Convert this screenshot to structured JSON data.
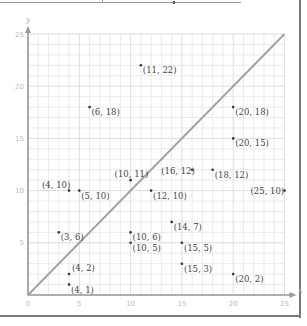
{
  "chart_data": {
    "type": "scatter",
    "title": "",
    "xlabel": "x",
    "ylabel": "y",
    "xlim": [
      0,
      25
    ],
    "ylim": [
      0,
      25
    ],
    "grid": true,
    "x_ticks": [
      0,
      5,
      10,
      15,
      20,
      25
    ],
    "y_ticks": [
      5,
      10,
      15,
      20,
      25
    ],
    "points": [
      {
        "x": 11,
        "y": 22,
        "label": "(11, 22)"
      },
      {
        "x": 6,
        "y": 18,
        "label": "(6, 18)"
      },
      {
        "x": 20,
        "y": 18,
        "label": "(20, 18)"
      },
      {
        "x": 20,
        "y": 15,
        "label": "(20, 15)"
      },
      {
        "x": 10,
        "y": 11,
        "label": "(10, 11)"
      },
      {
        "x": 16,
        "y": 12,
        "label": "(16, 12)"
      },
      {
        "x": 18,
        "y": 12,
        "label": "(18, 12)"
      },
      {
        "x": 4,
        "y": 10,
        "label": "(4, 10)"
      },
      {
        "x": 5,
        "y": 10,
        "label": "(5, 10)"
      },
      {
        "x": 12,
        "y": 10,
        "label": "(12, 10)"
      },
      {
        "x": 25,
        "y": 10,
        "label": "(25, 10)"
      },
      {
        "x": 10,
        "y": 6,
        "label": "(10, 6)"
      },
      {
        "x": 14,
        "y": 7,
        "label": "(14, 7)"
      },
      {
        "x": 3,
        "y": 6,
        "label": "(3, 6)"
      },
      {
        "x": 10,
        "y": 5,
        "label": "(10, 5)"
      },
      {
        "x": 15,
        "y": 5,
        "label": "(15, 5)"
      },
      {
        "x": 15,
        "y": 3,
        "label": "(15, 3)"
      },
      {
        "x": 4,
        "y": 2,
        "label": "(4, 2)"
      },
      {
        "x": 20,
        "y": 2,
        "label": "(20, 2)"
      },
      {
        "x": 4,
        "y": 1,
        "label": "(4, 1)"
      }
    ],
    "reference_line": {
      "from": [
        0,
        0
      ],
      "to": [
        25,
        25
      ],
      "label": "y = x"
    }
  },
  "axis": {
    "x_name": "x",
    "y_name": "y",
    "x_tick_labels": [
      "0",
      "5",
      "10",
      "15",
      "20",
      "25"
    ],
    "y_tick_labels": [
      "5",
      "10",
      "15",
      "20",
      "25"
    ]
  },
  "colors": {
    "grid": "#e2e2e2",
    "grid_major": "#d0d0d0",
    "axis": "#9a9a9a",
    "reference_line": "#a0a0a0",
    "point": "#333333",
    "label": "#444444"
  }
}
